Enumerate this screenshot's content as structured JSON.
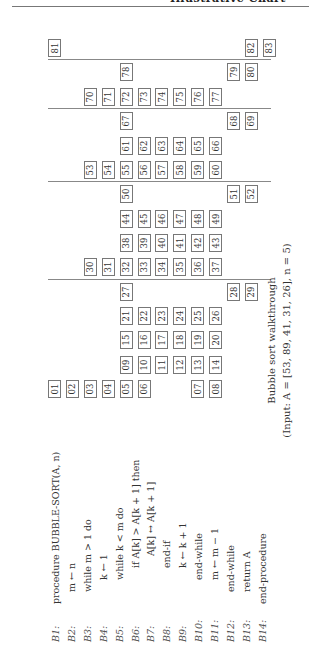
{
  "header": {
    "running_title": "Illustrative Chart"
  },
  "code": [
    {
      "label": "B1:",
      "indent": 0,
      "text": "procedure BUBBLE-SORT(A, n)"
    },
    {
      "label": "B2:",
      "indent": 1,
      "text": "m ← n"
    },
    {
      "label": "B3:",
      "indent": 1,
      "text": "while m > 1 do"
    },
    {
      "label": "B4:",
      "indent": 2,
      "text": "k ← 1"
    },
    {
      "label": "B5:",
      "indent": 2,
      "text": "while k < m do"
    },
    {
      "label": "B6:",
      "indent": 3,
      "text": "if A[k] > A[k + 1] then"
    },
    {
      "label": "B7:",
      "indent": 4,
      "text": "A[k] ↔ A[k + 1]"
    },
    {
      "label": "B8:",
      "indent": 3,
      "text": "end-if"
    },
    {
      "label": "B9:",
      "indent": 3,
      "text": "k ← k + 1"
    },
    {
      "label": "B10:",
      "indent": 2,
      "text": "end-while"
    },
    {
      "label": "B11:",
      "indent": 2,
      "text": "m ← m − 1"
    },
    {
      "label": "B12:",
      "indent": 1,
      "text": "end-while"
    },
    {
      "label": "B13:",
      "indent": 1,
      "text": "return A"
    },
    {
      "label": "B14:",
      "indent": 0,
      "text": "end-procedure"
    }
  ],
  "steps": [
    {
      "row": 0,
      "items": [
        [
          "01",
          0
        ],
        [
          "02",
          1
        ],
        [
          "03",
          2
        ],
        [
          "04",
          3
        ],
        [
          "05",
          4
        ],
        [
          "06",
          5
        ],
        [
          "07",
          8
        ],
        [
          "08",
          9
        ]
      ]
    },
    {
      "row": 1,
      "items": [
        [
          "09",
          4
        ],
        [
          "10",
          5
        ],
        [
          "11",
          6
        ],
        [
          "12",
          7
        ],
        [
          "13",
          8
        ],
        [
          "14",
          9
        ]
      ]
    },
    {
      "row": 2,
      "items": [
        [
          "15",
          4
        ],
        [
          "16",
          5
        ],
        [
          "17",
          6
        ],
        [
          "18",
          7
        ],
        [
          "19",
          8
        ],
        [
          "20",
          9
        ]
      ]
    },
    {
      "row": 3,
      "items": [
        [
          "21",
          4
        ],
        [
          "22",
          5
        ],
        [
          "23",
          6
        ],
        [
          "24",
          7
        ],
        [
          "25",
          8
        ],
        [
          "26",
          9
        ]
      ]
    },
    {
      "row": 4,
      "items": [
        [
          "27",
          4
        ],
        [
          "28",
          10
        ],
        [
          "29",
          11
        ]
      ]
    },
    {
      "row": 5,
      "items": [
        [
          "30",
          2
        ],
        [
          "31",
          3
        ],
        [
          "32",
          4
        ],
        [
          "33",
          5
        ],
        [
          "34",
          6
        ],
        [
          "35",
          7
        ],
        [
          "36",
          8
        ],
        [
          "37",
          9
        ]
      ]
    },
    {
      "row": 6,
      "items": [
        [
          "38",
          4
        ],
        [
          "39",
          5
        ],
        [
          "40",
          6
        ],
        [
          "41",
          7
        ],
        [
          "42",
          8
        ],
        [
          "43",
          9
        ]
      ]
    },
    {
      "row": 7,
      "items": [
        [
          "44",
          4
        ],
        [
          "45",
          5
        ],
        [
          "46",
          6
        ],
        [
          "47",
          7
        ],
        [
          "48",
          8
        ],
        [
          "49",
          9
        ]
      ]
    },
    {
      "row": 8,
      "items": [
        [
          "50",
          4
        ],
        [
          "51",
          10
        ],
        [
          "52",
          11
        ]
      ]
    },
    {
      "row": 9,
      "items": [
        [
          "53",
          2
        ],
        [
          "54",
          3
        ],
        [
          "55",
          4
        ],
        [
          "56",
          5
        ],
        [
          "57",
          6
        ],
        [
          "58",
          7
        ],
        [
          "59",
          8
        ],
        [
          "60",
          9
        ]
      ]
    },
    {
      "row": 10,
      "items": [
        [
          "61",
          4
        ],
        [
          "62",
          5
        ],
        [
          "63",
          6
        ],
        [
          "64",
          7
        ],
        [
          "65",
          8
        ],
        [
          "66",
          9
        ]
      ]
    },
    {
      "row": 11,
      "items": [
        [
          "67",
          4
        ],
        [
          "68",
          10
        ],
        [
          "69",
          11
        ]
      ]
    },
    {
      "row": 12,
      "items": [
        [
          "70",
          2
        ],
        [
          "71",
          3
        ],
        [
          "72",
          4
        ],
        [
          "73",
          5
        ],
        [
          "74",
          6
        ],
        [
          "75",
          7
        ],
        [
          "76",
          8
        ],
        [
          "77",
          9
        ]
      ]
    },
    {
      "row": 13,
      "items": [
        [
          "78",
          4
        ],
        [
          "79",
          10
        ],
        [
          "80",
          11
        ]
      ]
    },
    {
      "row": 14,
      "items": [
        [
          "81",
          0
        ],
        [
          "82",
          11
        ],
        [
          "83",
          12
        ]
      ]
    }
  ],
  "separators_after_rows": [
    4,
    8,
    11,
    13
  ],
  "caption": {
    "line1": "Bubble sort walkthrough",
    "line2": "(Input: A = [53, 89, 41, 31, 26], n = 5)"
  }
}
